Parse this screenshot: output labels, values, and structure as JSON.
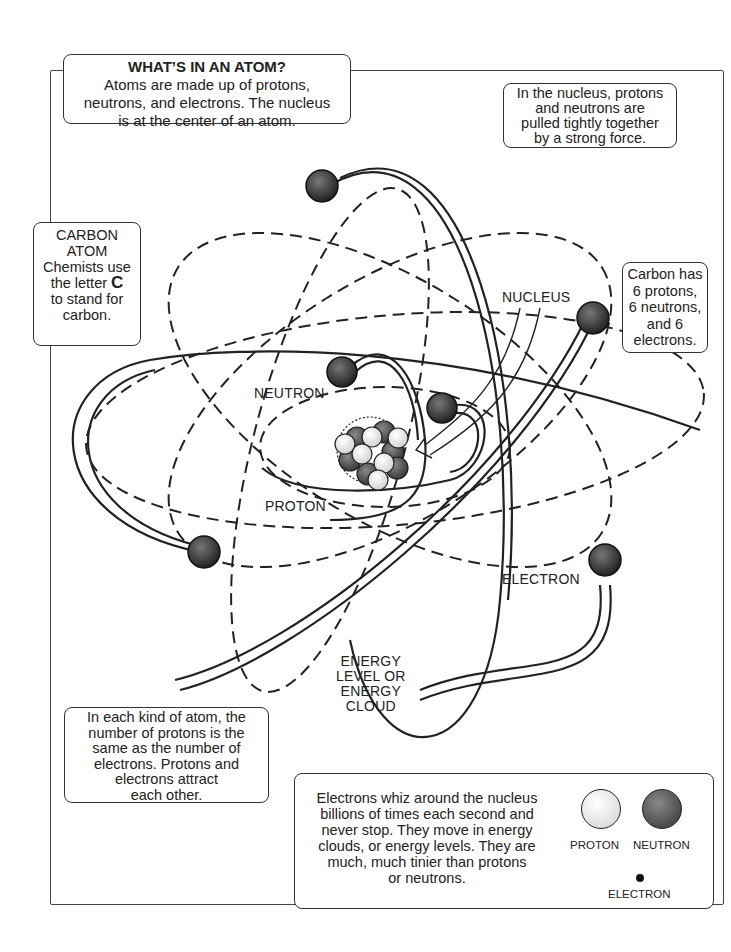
{
  "title_box": {
    "title": "WHAT’S IN AN ATOM?",
    "lines": [
      "Atoms are made up of protons,",
      "neutrons, and electrons. The nucleus",
      "is at the center of an atom."
    ]
  },
  "nucleus_box": {
    "lines": [
      "In the nucleus, protons",
      "and neutrons are",
      "pulled tightly together",
      "by a strong force."
    ]
  },
  "carbon_box": {
    "lines": [
      "CARBON",
      "ATOM",
      "Chemists use",
      "the letter ",
      "C",
      "to stand for",
      "carbon."
    ]
  },
  "count_box": {
    "lines": [
      "Carbon has",
      "6 protons,",
      "6 neutrons,",
      "and 6",
      "electrons."
    ]
  },
  "equal_box": {
    "lines": [
      "In each kind of atom, the",
      "number of protons is the",
      "same as the number of",
      "electrons. Protons and",
      "electrons attract",
      "each other."
    ]
  },
  "electron_box": {
    "lines": [
      "Electrons whiz around the nucleus",
      "billions of times each second and",
      "never stop. They move in energy",
      "clouds, or energy levels. They are",
      "much, much tinier than protons",
      "or neutrons."
    ]
  },
  "legend": {
    "proton": "PROTON",
    "neutron": "NEUTRON",
    "electron": "ELECTRON"
  },
  "labels": {
    "nucleus": "NUCLEUS",
    "neutron": "NEUTRON",
    "proton": "PROTON",
    "electron": "ELECTRON",
    "energy": [
      "ENERGY",
      "LEVEL OR",
      "ENERGY",
      "CLOUD"
    ]
  },
  "colors": {
    "ink": "#222222",
    "electron_fill": "#3a3a3a",
    "proton_fill": "#f4f4f4",
    "neutron_fill": "#555555"
  }
}
